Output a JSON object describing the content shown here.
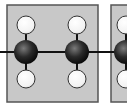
{
  "diagram": {
    "type": "ball-and-stick polymer repeat unit",
    "colors": {
      "box_fill": "#c8c8c8",
      "box_stroke": "#555555",
      "carbon": "#2a2a2a",
      "hydrogen": "#ffffff",
      "bond": "#111111",
      "background": "#ffffff"
    },
    "repeat_units": [
      {
        "box": {
          "x": 7,
          "y": 5,
          "w": 91,
          "h": 97
        },
        "atoms": [
          {
            "element": "C",
            "x": 26,
            "y": 52,
            "r": 12
          },
          {
            "element": "C",
            "x": 77,
            "y": 52,
            "r": 12
          },
          {
            "element": "H",
            "x": 26,
            "y": 25,
            "r": 9
          },
          {
            "element": "H",
            "x": 77,
            "y": 25,
            "r": 9
          },
          {
            "element": "H",
            "x": 26,
            "y": 79,
            "r": 9
          },
          {
            "element": "H",
            "x": 77,
            "y": 79,
            "r": 9
          }
        ]
      },
      {
        "box": {
          "x": 111,
          "y": 5,
          "w": 30,
          "h": 97
        },
        "atoms": [
          {
            "element": "C",
            "x": 126,
            "y": 52,
            "r": 12
          },
          {
            "element": "H",
            "x": 126,
            "y": 25,
            "r": 9
          },
          {
            "element": "H",
            "x": 126,
            "y": 79,
            "r": 9
          }
        ]
      }
    ],
    "backbone": {
      "y": 52,
      "x1": 0,
      "x2": 127
    }
  }
}
